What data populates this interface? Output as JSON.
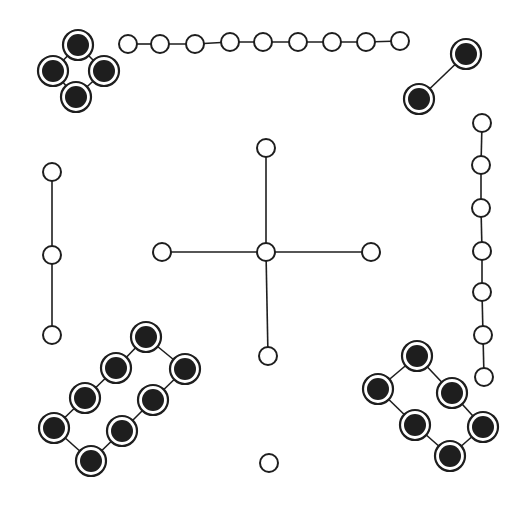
{
  "colors": {
    "ink": "#1e1e1e",
    "background": "#ffffff"
  },
  "node_style": {
    "open_radius": 9,
    "filled_ring_radius": 15,
    "filled_core_radius": 11
  },
  "graphs": [
    {
      "name": "filled-cycle-4",
      "type": "filled",
      "nodes": [
        [
          78,
          45
        ],
        [
          53,
          71
        ],
        [
          104,
          71
        ],
        [
          76,
          97
        ]
      ],
      "edges": [
        [
          0,
          1
        ],
        [
          0,
          2
        ],
        [
          1,
          3
        ],
        [
          2,
          3
        ]
      ]
    },
    {
      "name": "open-path-9",
      "type": "open",
      "nodes": [
        [
          128,
          44
        ],
        [
          160,
          44
        ],
        [
          195,
          44
        ],
        [
          230,
          42
        ],
        [
          263,
          42
        ],
        [
          298,
          42
        ],
        [
          332,
          42
        ],
        [
          366,
          42
        ],
        [
          400,
          41
        ]
      ],
      "edges": [
        [
          0,
          1
        ],
        [
          1,
          2
        ],
        [
          2,
          3
        ],
        [
          3,
          4
        ],
        [
          4,
          5
        ],
        [
          5,
          6
        ],
        [
          6,
          7
        ],
        [
          7,
          8
        ]
      ]
    },
    {
      "name": "filled-edge-2",
      "type": "filled",
      "nodes": [
        [
          466,
          54
        ],
        [
          419,
          99
        ]
      ],
      "edges": [
        [
          0,
          1
        ]
      ]
    },
    {
      "name": "open-path-7",
      "type": "open",
      "nodes": [
        [
          482,
          123
        ],
        [
          481,
          165
        ],
        [
          481,
          208
        ],
        [
          482,
          251
        ],
        [
          482,
          292
        ],
        [
          483,
          335
        ],
        [
          484,
          377
        ]
      ],
      "edges": [
        [
          0,
          1
        ],
        [
          1,
          2
        ],
        [
          2,
          3
        ],
        [
          3,
          4
        ],
        [
          4,
          5
        ],
        [
          5,
          6
        ]
      ]
    },
    {
      "name": "open-path-3",
      "type": "open",
      "nodes": [
        [
          52,
          172
        ],
        [
          52,
          255
        ],
        [
          52,
          335
        ]
      ],
      "edges": [
        [
          0,
          1
        ],
        [
          1,
          2
        ]
      ]
    },
    {
      "name": "open-star-5",
      "type": "open",
      "nodes": [
        [
          266,
          148
        ],
        [
          162,
          252
        ],
        [
          266,
          252
        ],
        [
          371,
          252
        ],
        [
          268,
          356
        ]
      ],
      "edges": [
        [
          0,
          2
        ],
        [
          1,
          2
        ],
        [
          2,
          3
        ],
        [
          2,
          4
        ]
      ]
    },
    {
      "name": "filled-cycle-8",
      "type": "filled",
      "nodes": [
        [
          146,
          337
        ],
        [
          116,
          368
        ],
        [
          185,
          369
        ],
        [
          85,
          398
        ],
        [
          153,
          400
        ],
        [
          54,
          428
        ],
        [
          122,
          431
        ],
        [
          91,
          461
        ]
      ],
      "edges": [
        [
          0,
          1
        ],
        [
          0,
          2
        ],
        [
          1,
          3
        ],
        [
          3,
          5
        ],
        [
          5,
          7
        ],
        [
          2,
          4
        ],
        [
          4,
          6
        ],
        [
          6,
          7
        ]
      ]
    },
    {
      "name": "filled-cycle-6",
      "type": "filled",
      "nodes": [
        [
          417,
          356
        ],
        [
          378,
          389
        ],
        [
          452,
          393
        ],
        [
          415,
          425
        ],
        [
          483,
          427
        ],
        [
          450,
          456
        ]
      ],
      "edges": [
        [
          0,
          1
        ],
        [
          0,
          2
        ],
        [
          1,
          3
        ],
        [
          2,
          4
        ],
        [
          3,
          5
        ],
        [
          4,
          5
        ]
      ]
    },
    {
      "name": "open-isolated-1",
      "type": "open",
      "nodes": [
        [
          269,
          463
        ]
      ],
      "edges": []
    }
  ]
}
